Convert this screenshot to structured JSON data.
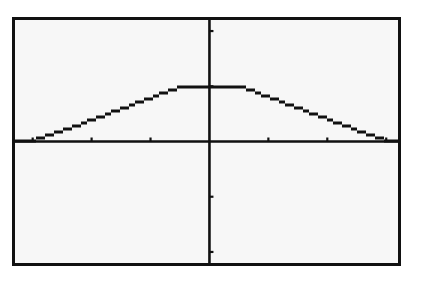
{
  "chart_data": {
    "type": "line",
    "title": "",
    "xlabel": "",
    "ylabel": "",
    "xlim": [
      -3.3,
      3.2
    ],
    "ylim": [
      -2.2,
      2.2
    ],
    "xticks": [
      -3,
      -2,
      -1,
      1,
      2,
      3
    ],
    "yticks": [
      -2,
      -1,
      1,
      2
    ],
    "grid": false,
    "legend": null,
    "series": [
      {
        "name": "y1",
        "style": "stepped-pixel",
        "x": [
          -3.3,
          -3.0,
          -2.5,
          -2.0,
          -1.5,
          -1.0,
          -0.5,
          0.0,
          0.5,
          1.0,
          1.5,
          2.0,
          2.5,
          3.0,
          3.2
        ],
        "y": [
          0.0,
          0.02,
          0.2,
          0.4,
          0.6,
          0.8,
          1.0,
          1.0,
          1.0,
          0.8,
          0.6,
          0.4,
          0.2,
          0.02,
          0.0
        ]
      }
    ]
  },
  "screen": {
    "frame_color": "#111111",
    "background_color": "#f7f7f7",
    "axis_color": "#111111",
    "curve_color": "#111111"
  }
}
